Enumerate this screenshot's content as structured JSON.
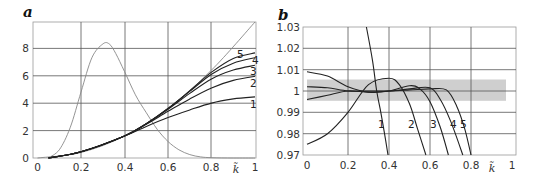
{
  "chart_data": [
    {
      "panel": "a",
      "type": "line",
      "title": "",
      "xlabel": "k̃",
      "ylabel": "",
      "xlim": [
        0,
        1
      ],
      "ylim": [
        0,
        9.9
      ],
      "grid": true,
      "x_ticks": [
        "0",
        "0.2",
        "0.4",
        "0.6",
        "0.8",
        "1"
      ],
      "y_ticks": [
        "0",
        "2",
        "4",
        "6",
        "8"
      ],
      "series": [
        {
          "name": "diagonal (reference)",
          "color": "#888888",
          "x": [
            0.0,
            0.2,
            0.4,
            0.6,
            0.8,
            1.0
          ],
          "y": [
            0.0,
            0.4,
            1.6,
            3.6,
            6.4,
            10.0
          ]
        },
        {
          "name": "spectrum (bell curve)",
          "color": "#888888",
          "x": [
            0.05,
            0.1,
            0.15,
            0.2,
            0.25,
            0.3,
            0.33,
            0.36,
            0.4,
            0.45,
            0.5,
            0.55,
            0.6,
            0.65,
            0.7,
            0.75,
            0.8,
            0.9,
            1.0
          ],
          "y": [
            0.0,
            0.6,
            2.2,
            4.8,
            7.3,
            8.3,
            8.3,
            7.6,
            6.3,
            4.6,
            3.3,
            2.1,
            1.2,
            0.6,
            0.25,
            0.08,
            0.02,
            0.0,
            0.0
          ]
        },
        {
          "name": "1",
          "color": "#222222",
          "x": [
            0.05,
            0.2,
            0.4,
            0.5,
            0.6,
            0.7,
            0.8,
            0.9,
            1.0
          ],
          "y": [
            0.0,
            0.45,
            1.6,
            2.3,
            2.95,
            3.5,
            4.0,
            4.3,
            4.45
          ]
        },
        {
          "name": "2",
          "color": "#222222",
          "x": [
            0.05,
            0.2,
            0.4,
            0.5,
            0.6,
            0.7,
            0.8,
            0.9,
            1.0
          ],
          "y": [
            0.0,
            0.45,
            1.6,
            2.45,
            3.4,
            4.3,
            5.1,
            5.65,
            5.95
          ]
        },
        {
          "name": "3",
          "color": "#222222",
          "x": [
            0.05,
            0.2,
            0.4,
            0.5,
            0.6,
            0.7,
            0.8,
            0.9,
            1.0
          ],
          "y": [
            0.0,
            0.45,
            1.6,
            2.5,
            3.55,
            4.7,
            5.75,
            6.4,
            6.75
          ]
        },
        {
          "name": "4",
          "color": "#222222",
          "x": [
            0.05,
            0.2,
            0.4,
            0.5,
            0.6,
            0.7,
            0.8,
            0.9,
            1.0
          ],
          "y": [
            0.0,
            0.45,
            1.6,
            2.5,
            3.6,
            4.85,
            6.1,
            6.9,
            7.3
          ]
        },
        {
          "name": "5",
          "color": "#222222",
          "x": [
            0.05,
            0.2,
            0.4,
            0.5,
            0.6,
            0.7,
            0.8,
            0.9,
            1.0
          ],
          "y": [
            0.0,
            0.45,
            1.6,
            2.5,
            3.6,
            4.9,
            6.25,
            7.25,
            7.65
          ]
        }
      ],
      "annotations": [
        "1",
        "2",
        "3",
        "4",
        "5"
      ]
    },
    {
      "panel": "b",
      "type": "line",
      "title": "",
      "xlabel": "k̃",
      "ylabel": "",
      "xlim": [
        0,
        1
      ],
      "ylim": [
        0.97,
        1.03
      ],
      "grid": true,
      "x_ticks": [
        "0",
        "0.2",
        "0.4",
        "0.6",
        "0.8",
        "1"
      ],
      "y_ticks": [
        "0.97",
        "0.98",
        "0.99",
        "1",
        "1.01",
        "1.02",
        "1.03"
      ],
      "shaded_band": {
        "y_from": 0.995,
        "y_to": 1.005,
        "x_from": 0.0,
        "x_to": 0.98,
        "color": "#cfcfcf"
      },
      "series": [
        {
          "name": "1",
          "color": "#222222",
          "x": [
            0.29,
            0.32,
            0.34,
            0.36,
            0.38,
            0.395
          ],
          "y": [
            1.03,
            1.014,
            1.0,
            0.99,
            0.979,
            0.97
          ]
        },
        {
          "name": "2",
          "color": "#222222",
          "x": [
            0.0,
            0.1,
            0.2,
            0.3,
            0.4,
            0.45,
            0.5,
            0.54,
            0.58
          ],
          "y": [
            0.975,
            0.98,
            0.99,
            1.003,
            1.006,
            1.003,
            0.994,
            0.982,
            0.97
          ]
        },
        {
          "name": "3",
          "color": "#222222",
          "x": [
            0.0,
            0.1,
            0.2,
            0.3,
            0.4,
            0.5,
            0.55,
            0.6,
            0.65,
            0.69
          ],
          "y": [
            1.009,
            1.007,
            1.002,
            0.9995,
            1.0,
            1.0025,
            1.001,
            0.995,
            0.983,
            0.97
          ]
        },
        {
          "name": "4",
          "color": "#222222",
          "x": [
            0.0,
            0.1,
            0.2,
            0.3,
            0.4,
            0.5,
            0.6,
            0.65,
            0.7,
            0.76
          ],
          "y": [
            0.996,
            0.998,
            1.0,
            0.9995,
            1.0,
            1.001,
            1.0015,
            0.996,
            0.986,
            0.97
          ]
        },
        {
          "name": "5",
          "color": "#222222",
          "x": [
            0.0,
            0.1,
            0.2,
            0.3,
            0.4,
            0.5,
            0.6,
            0.68,
            0.73,
            0.77,
            0.8
          ],
          "y": [
            1.002,
            1.0015,
            1.0,
            1.0,
            1.0,
            1.0005,
            1.001,
            1.0005,
            0.993,
            0.982,
            0.97
          ]
        }
      ],
      "annotations": [
        "1",
        "2",
        "3",
        "4",
        "5"
      ]
    }
  ],
  "labels": {
    "panel_a": "a",
    "panel_b": "b",
    "k_label": "k̃",
    "a_x_ticks": [
      "0",
      "0.2",
      "0.4",
      "0.6",
      "0.8",
      "1"
    ],
    "a_y_ticks": [
      "0",
      "2",
      "4",
      "6",
      "8"
    ],
    "b_x_ticks": [
      "0",
      "0.2",
      "0.4",
      "0.6",
      "0.8",
      "1"
    ],
    "b_y_ticks": [
      "0.97",
      "0.98",
      "0.99",
      "1",
      "1.01",
      "1.02",
      "1.03"
    ],
    "curve_labels": [
      "1",
      "2",
      "3",
      "4",
      "5"
    ]
  }
}
